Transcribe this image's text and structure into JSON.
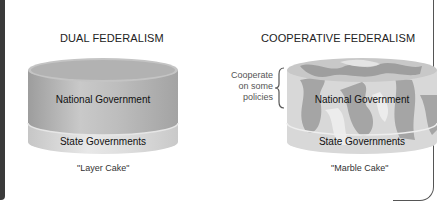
{
  "left_panel": {
    "title": "DUAL FEDERALISM",
    "top_layer": "National Government",
    "bottom_layer": "State Governments",
    "caption": "\"Layer Cake\""
  },
  "right_panel": {
    "title": "COOPERATIVE FEDERALISM",
    "top_layer": "National Government",
    "bottom_layer": "State Governments",
    "caption": "\"Marble Cake\"",
    "side_note": [
      "Cooperate",
      "on some",
      "policies"
    ]
  },
  "colors": {
    "dark_bar": "#3a3a3a",
    "national_layer": "#b9b9b9",
    "state_layer": "#d9d9d9",
    "marble_dark": "#9c9c9c",
    "marble_light": "#e2e2e2"
  }
}
